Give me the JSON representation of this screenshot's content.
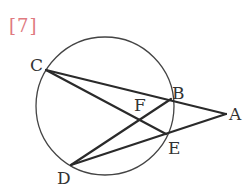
{
  "problem": {
    "label": "[7]",
    "label_color": "#e07a80"
  },
  "diagram": {
    "circle": {
      "cx": 105,
      "cy": 106,
      "r": 69
    },
    "points": {
      "A": {
        "x": 226,
        "y": 114,
        "label": "A",
        "lx": 229,
        "ly": 120
      },
      "B": {
        "x": 171,
        "y": 99,
        "label": "B",
        "lx": 172,
        "ly": 99
      },
      "C": {
        "x": 46,
        "y": 70,
        "label": "C",
        "lx": 30,
        "ly": 71
      },
      "D": {
        "x": 71,
        "y": 165,
        "label": "D",
        "lx": 57,
        "ly": 184
      },
      "E": {
        "x": 166,
        "y": 134,
        "label": "E",
        "lx": 168,
        "ly": 154
      },
      "F": {
        "x": 141,
        "y": 121,
        "label": "F",
        "lx": 134,
        "ly": 111
      }
    },
    "segments": [
      [
        "C",
        "A"
      ],
      [
        "C",
        "E"
      ],
      [
        "D",
        "B"
      ],
      [
        "D",
        "A"
      ]
    ],
    "stroke_color": "#2a2a2a",
    "circle_color": "#444444"
  }
}
